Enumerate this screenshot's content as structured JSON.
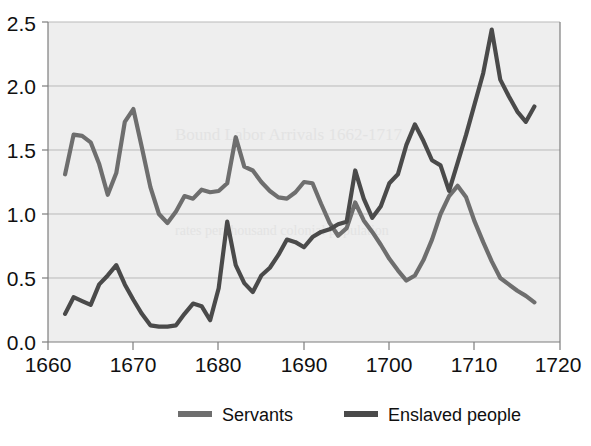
{
  "chart_data": {
    "type": "line",
    "title": "",
    "subtitle": "",
    "xlabel": "",
    "ylabel": "",
    "xlim": [
      1660,
      1720
    ],
    "ylim": [
      0.0,
      2.5
    ],
    "xticks": [
      1660,
      1670,
      1680,
      1690,
      1700,
      1710,
      1720
    ],
    "xtick_labels": [
      "1660",
      "1670",
      "1680",
      "1690",
      "1700",
      "1710",
      "1720"
    ],
    "yticks": [
      0.0,
      0.5,
      1.0,
      1.5,
      2.0,
      2.5
    ],
    "ytick_labels": [
      "0.0",
      "0.5",
      "1.0",
      "1.5",
      "2.0",
      "2.5"
    ],
    "grid": "horizontal",
    "legend_position": "bottom",
    "plot_background": "#eeeeee",
    "series": [
      {
        "name": "Servants",
        "color": "#6e6e6e",
        "x": [
          1662,
          1663,
          1664,
          1665,
          1666,
          1667,
          1668,
          1669,
          1670,
          1671,
          1672,
          1673,
          1674,
          1675,
          1676,
          1677,
          1678,
          1679,
          1680,
          1681,
          1682,
          1683,
          1684,
          1685,
          1686,
          1687,
          1688,
          1689,
          1690,
          1691,
          1692,
          1693,
          1694,
          1695,
          1696,
          1697,
          1698,
          1699,
          1700,
          1701,
          1702,
          1703,
          1704,
          1705,
          1706,
          1707,
          1708,
          1709,
          1710,
          1711,
          1712,
          1713,
          1714,
          1715,
          1716,
          1717
        ],
        "values": [
          1.31,
          1.62,
          1.61,
          1.56,
          1.39,
          1.15,
          1.32,
          1.72,
          1.82,
          1.52,
          1.21,
          1.0,
          0.93,
          1.02,
          1.14,
          1.12,
          1.19,
          1.17,
          1.18,
          1.24,
          1.6,
          1.37,
          1.34,
          1.25,
          1.18,
          1.13,
          1.12,
          1.17,
          1.25,
          1.24,
          1.08,
          0.93,
          0.83,
          0.89,
          1.09,
          0.95,
          0.86,
          0.76,
          0.65,
          0.56,
          0.48,
          0.52,
          0.64,
          0.8,
          1.0,
          1.14,
          1.22,
          1.13,
          0.94,
          0.78,
          0.63,
          0.5,
          0.45,
          0.4,
          0.36,
          0.31
        ],
        "note": "second half continues declining to about 0.25 by 1717"
      },
      {
        "name": "Enslaved people",
        "color": "#4a4a4a",
        "x": [
          1662,
          1663,
          1664,
          1665,
          1666,
          1667,
          1668,
          1669,
          1670,
          1671,
          1672,
          1673,
          1674,
          1675,
          1676,
          1677,
          1678,
          1679,
          1680,
          1681,
          1682,
          1683,
          1684,
          1685,
          1686,
          1687,
          1688,
          1689,
          1690,
          1691,
          1692,
          1693,
          1694,
          1695,
          1696,
          1697,
          1698,
          1699,
          1700,
          1701,
          1702,
          1703,
          1704,
          1705,
          1706,
          1707,
          1708,
          1709,
          1710,
          1711,
          1712,
          1713,
          1714,
          1715,
          1716,
          1717
        ],
        "values": [
          0.22,
          0.35,
          0.32,
          0.29,
          0.45,
          0.52,
          0.6,
          0.45,
          0.33,
          0.22,
          0.13,
          0.12,
          0.12,
          0.13,
          0.22,
          0.3,
          0.28,
          0.17,
          0.42,
          0.94,
          0.6,
          0.46,
          0.39,
          0.52,
          0.58,
          0.68,
          0.8,
          0.78,
          0.74,
          0.82,
          0.86,
          0.88,
          0.92,
          0.94,
          1.34,
          1.12,
          0.97,
          1.06,
          1.24,
          1.31,
          1.54,
          1.7,
          1.57,
          1.42,
          1.38,
          1.18,
          1.4,
          1.62,
          1.86,
          2.1,
          2.44,
          2.05,
          1.92,
          1.8,
          1.72,
          1.84
        ],
        "note": "peaks at about 2.44 near 1712, ends about 1.84"
      }
    ],
    "legend_entries": [
      {
        "label": "Servants",
        "color": "#6e6e6e"
      },
      {
        "label": "Enslaved people",
        "color": "#4a4a4a"
      }
    ]
  },
  "legend": {
    "servants_label": "Servants",
    "enslaved_label": "Enslaved people"
  },
  "axes": {
    "y_0": "0.0",
    "y_1": "0.5",
    "y_2": "1.0",
    "y_3": "1.5",
    "y_4": "2.0",
    "y_5": "2.5",
    "x_0": "1660",
    "x_1": "1670",
    "x_2": "1680",
    "x_3": "1690",
    "x_4": "1700",
    "x_5": "1710",
    "x_6": "1720"
  }
}
